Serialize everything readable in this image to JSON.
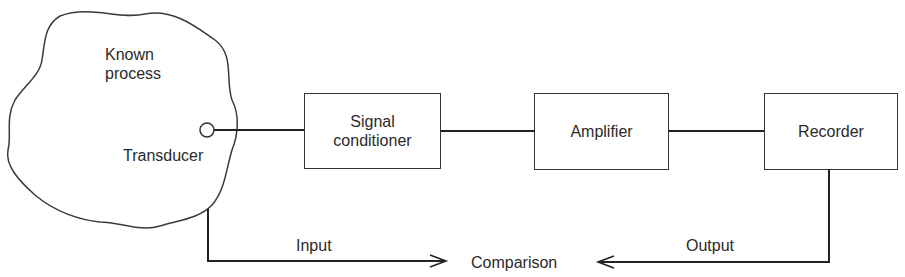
{
  "diagram": {
    "process": {
      "label_line1": "Known",
      "label_line2": "process"
    },
    "transducer": {
      "label": "Transducer"
    },
    "blocks": [
      {
        "id": "signal-conditioner",
        "line1": "Signal",
        "line2": "conditioner"
      },
      {
        "id": "amplifier",
        "line1": "Amplifier"
      },
      {
        "id": "recorder",
        "line1": "Recorder"
      }
    ],
    "feedback": {
      "input_label": "Input",
      "output_label": "Output",
      "comparison_label": "Comparison"
    }
  }
}
